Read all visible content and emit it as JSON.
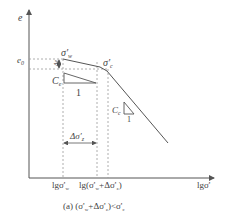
{
  "figure": {
    "y_axis_label": "e",
    "x_axis_label": "lgσ'",
    "e0_label": "e",
    "e0_sub": "0",
    "delta_e_label": "Δe",
    "point_w_label": "σ'",
    "point_w_sub": "w",
    "point_c_label": "σ'",
    "point_c_sub": "c",
    "ce_label": "C",
    "ce_sub": "e",
    "ce_run": "1",
    "cc_label": "C",
    "cc_sub": "c",
    "cc_run": "1",
    "delta_sigma_label": "Δσ'",
    "delta_sigma_sub": "z",
    "tick1_label": "lgσ'",
    "tick1_sub": "w",
    "tick2_label": "lg(σ'",
    "tick2_sub": "w",
    "tick2_rest": "+Δσ'",
    "tick2_sub2": "z",
    "tick2_close": ")",
    "caption_prefix": "(a) (σ'",
    "caption_sub1": "w",
    "caption_mid": "+Δσ'",
    "caption_sub2": "z",
    "caption_rel": ")<σ'",
    "caption_sub3": "c",
    "colors": {
      "line": "#555555",
      "dash": "#888888"
    }
  }
}
